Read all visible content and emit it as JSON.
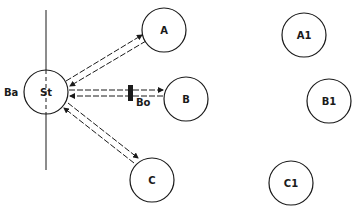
{
  "diagram": {
    "nodes": [
      {
        "id": "St",
        "label": "St",
        "cx": 46,
        "cy": 92,
        "r": 22
      },
      {
        "id": "A",
        "label": "A",
        "cx": 164,
        "cy": 30,
        "r": 22
      },
      {
        "id": "B",
        "label": "B",
        "cx": 186,
        "cy": 99,
        "r": 22
      },
      {
        "id": "C",
        "label": "C",
        "cx": 152,
        "cy": 180,
        "r": 22
      },
      {
        "id": "A1",
        "label": "A1",
        "cx": 304,
        "cy": 35,
        "r": 22
      },
      {
        "id": "B1",
        "label": "B1",
        "cx": 329,
        "cy": 101,
        "r": 22
      },
      {
        "id": "C1",
        "label": "C1",
        "cx": 291,
        "cy": 183,
        "r": 22
      }
    ],
    "side_label": "Ba",
    "barrier_label": "Bo",
    "edges": [
      {
        "from": "St",
        "to": "A",
        "type": "bidirectional-dashed"
      },
      {
        "from": "St",
        "to": "B",
        "type": "bidirectional-dashed",
        "blocked_by": "Bo"
      },
      {
        "from": "St",
        "to": "C",
        "type": "bidirectional-dashed"
      }
    ],
    "stroke_color": "#1a1a1a",
    "background": "#ffffff"
  }
}
